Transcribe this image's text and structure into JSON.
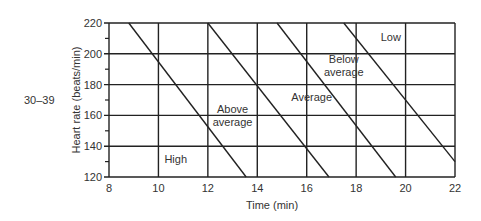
{
  "row_label": "30–39",
  "chart_data": {
    "type": "line",
    "title": "",
    "xlabel": "Time (min)",
    "ylabel": "Heart rate (beats/min)",
    "xlim": [
      8,
      22
    ],
    "ylim": [
      120,
      220
    ],
    "x_ticks": [
      8,
      10,
      12,
      14,
      16,
      18,
      20,
      22
    ],
    "y_ticks": [
      120,
      140,
      160,
      180,
      200,
      220
    ],
    "y_minor_ticks": [
      130,
      150,
      170,
      190,
      210
    ],
    "grid": true,
    "series": [
      {
        "name": "High / Above average boundary",
        "points": [
          [
            8.8,
            220
          ],
          [
            13.55,
            120
          ]
        ]
      },
      {
        "name": "Above average / Average boundary",
        "points": [
          [
            12.0,
            220
          ],
          [
            16.9,
            120
          ]
        ]
      },
      {
        "name": "Average / Below average boundary",
        "points": [
          [
            14.8,
            220
          ],
          [
            19.6,
            120
          ]
        ]
      },
      {
        "name": "Below average / Low boundary",
        "points": [
          [
            17.5,
            220
          ],
          [
            22.0,
            130
          ]
        ]
      }
    ],
    "annotations": [
      {
        "text": "High",
        "x": 10.7,
        "y": 132
      },
      {
        "text": "Above average",
        "x": 13.0,
        "y": 160
      },
      {
        "text": "Average",
        "x": 16.2,
        "y": 172
      },
      {
        "text": "Below average",
        "x": 17.5,
        "y": 193
      },
      {
        "text": "Low",
        "x": 19.4,
        "y": 211
      }
    ]
  }
}
